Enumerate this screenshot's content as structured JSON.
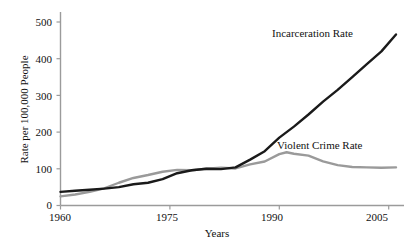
{
  "chart_data": {
    "type": "line",
    "title": "",
    "subtitle": "",
    "xlabel": "Years",
    "ylabel": "Rate per 100,000 People",
    "xlim": [
      1960,
      2006
    ],
    "ylim": [
      0,
      520
    ],
    "xticks": [
      1960,
      1975,
      1990,
      2005
    ],
    "xtick_labels": [
      "1960",
      "1975",
      "1990",
      "2005"
    ],
    "yticks": [
      0,
      100,
      200,
      300,
      400,
      500
    ],
    "ytick_labels": [
      "0",
      "100",
      "200",
      "300",
      "400",
      "500"
    ],
    "grid": false,
    "legend_position": "inline-annotations",
    "series": [
      {
        "name": "Incarceration Rate",
        "color": "#1a1a1a",
        "width": 2.4,
        "x": [
          1960,
          1962,
          1964,
          1966,
          1968,
          1970,
          1972,
          1974,
          1976,
          1978,
          1980,
          1982,
          1984,
          1986,
          1988,
          1990,
          1992,
          1994,
          1996,
          1998,
          2000,
          2002,
          2004,
          2006
        ],
        "values": [
          37,
          40,
          43,
          46,
          50,
          58,
          62,
          72,
          88,
          96,
          100,
          99,
          104,
          125,
          148,
          185,
          215,
          248,
          283,
          315,
          350,
          385,
          420,
          466
        ]
      },
      {
        "name": "Violent Crime Rate",
        "color": "#9a9a9a",
        "width": 2.4,
        "x": [
          1960,
          1962,
          1964,
          1966,
          1968,
          1970,
          1972,
          1974,
          1976,
          1978,
          1980,
          1982,
          1984,
          1986,
          1988,
          1990,
          1991,
          1992,
          1994,
          1996,
          1998,
          2000,
          2002,
          2004,
          2006
        ],
        "values": [
          25,
          30,
          37,
          47,
          62,
          75,
          83,
          92,
          97,
          96,
          100,
          103,
          101,
          112,
          120,
          140,
          145,
          141,
          136,
          120,
          110,
          105,
          104,
          103,
          104
        ]
      }
    ],
    "annotations": [
      {
        "text": "Incarceration Rate",
        "series": "Incarceration Rate"
      },
      {
        "text": "Violent Crime Rate",
        "series": "Violent Crime Rate"
      }
    ]
  },
  "axes": {
    "ylabel": "Rate per 100,000 People",
    "xlabel": "Years",
    "ytick_labels": [
      "500",
      "400",
      "300",
      "200",
      "100",
      "0"
    ],
    "xtick_labels": [
      "1960",
      "1975",
      "1990",
      "2005"
    ]
  },
  "labels": {
    "incarceration": "Incarceration Rate",
    "violent_crime": "Violent Crime Rate"
  },
  "colors": {
    "incarceration_line": "#1a1a1a",
    "violent_crime_line": "#9a9a9a",
    "axis": "#9b9b9b",
    "text": "#111111",
    "background": "#ffffff"
  }
}
